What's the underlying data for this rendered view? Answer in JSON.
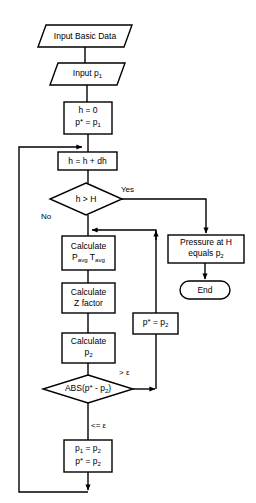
{
  "diagram": {
    "background_color": "#ffffff",
    "stroke_color": "#000000",
    "text_color": "#000000"
  },
  "nodes": {
    "input_basic_data": {
      "shape": "parallelogram",
      "label": "Input Basic Data"
    },
    "input_p1": {
      "shape": "parallelogram",
      "label_line1": "Input p",
      "label_sub1": "1"
    },
    "init": {
      "shape": "process",
      "line1": "h = 0",
      "line2_a": "p",
      "line2_star": "*",
      "line2_b": " = p",
      "line2_sub": "1"
    },
    "increment": {
      "shape": "process",
      "label": "h = h + dh"
    },
    "decision_h": {
      "shape": "decision",
      "label": "h > H"
    },
    "pressure_at_h": {
      "shape": "process",
      "line1": "Pressure at H",
      "line2_a": "equals p",
      "line2_sub": "2"
    },
    "end": {
      "shape": "terminator",
      "label": "End"
    },
    "calc_avg": {
      "shape": "process",
      "line1": "Calculate",
      "line2_a": "P",
      "line2_sub_a": "avg",
      "line2_b": " T",
      "line2_sub_b": "avg"
    },
    "calc_z": {
      "shape": "process",
      "line1": "Calculate",
      "line2": "Z factor"
    },
    "calc_p2": {
      "shape": "process",
      "line1": "Calculate",
      "line2_a": "p",
      "line2_sub": "2"
    },
    "update_pstar": {
      "shape": "process",
      "line_a": "p",
      "line_star": "*",
      "line_b": " = p",
      "line_sub": "2"
    },
    "decision_abs": {
      "shape": "decision",
      "label_a": "ABS(p",
      "label_star": "*",
      "label_b": " - p",
      "label_sub": "2",
      "label_c": ")"
    },
    "assign_final": {
      "shape": "process",
      "line1_a": "p",
      "line1_sub_a": "1",
      "line1_b": " = p",
      "line1_sub_b": "2",
      "line2_a": "p",
      "line2_star": "*",
      "line2_b": " = p",
      "line2_sub": "2"
    }
  },
  "edge_labels": {
    "yes": "Yes",
    "no": "No",
    "greater_epsilon": "> ε",
    "lesser_equal_epsilon": "<= ε"
  }
}
